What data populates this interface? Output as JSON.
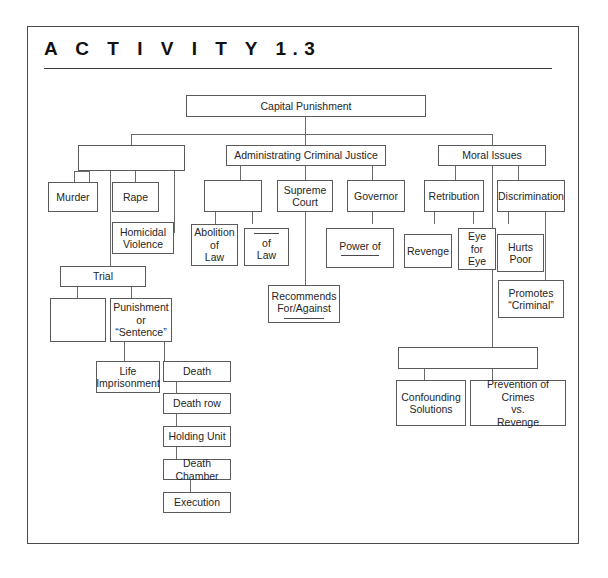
{
  "worksheet": {
    "title": "A C T I V I T Y   1.3",
    "title_plain": "ACTIVITY 1.3"
  },
  "diagram": {
    "type": "concept-map",
    "root": "Capital Punishment",
    "nodes": {
      "capital_punishment": "Capital Punishment",
      "crimes_blank": "",
      "murder": "Murder",
      "rape": "Rape",
      "homicidal_violence": "Homicidal\nViolence",
      "trial": "Trial",
      "trial_blank": "",
      "punishment": "Punishment\nor\n“Sentence”",
      "life_imprisonment": "Life\nImprisonment",
      "death": "Death",
      "death_row": "Death row",
      "holding_unit": "Holding Unit",
      "death_chamber": "Death Chamber",
      "execution": "Execution",
      "administrating": "Administrating  Criminal Justice",
      "admin_blank": "",
      "supreme_court": "Supreme\nCourt",
      "governor": "Governor",
      "abolition_of_law": "Abolition\nof\nLaw",
      "of_law": "of\nLaw",
      "power_of": "Power of",
      "recommends": "Recommends\nFor/Against",
      "moral_issues": "Moral Issues",
      "retribution": "Retribution",
      "discrimination": "Discrimination",
      "revenge": "Revenge",
      "eye_for_eye": "Eye\nfor\nEye",
      "hurts_poor": "Hurts\nPoor",
      "promotes_criminal": "Promotes\n“Criminal”",
      "moral_bottom_blank": "",
      "confounding_solutions": "Confounding\nSolutions",
      "prevention_vs_revenge": "Prevention of Crimes\nvs.\nRevenge"
    },
    "colors": {
      "box_border": "#5a5a5a",
      "connector": "#6a6a6a",
      "frame": "#4a4a4a",
      "text": "#262626",
      "background": "#ffffff"
    }
  }
}
